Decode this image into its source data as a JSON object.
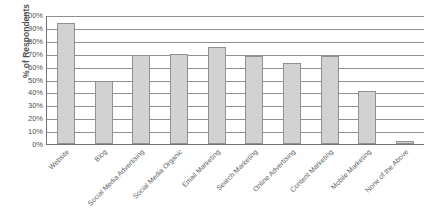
{
  "chart_data": {
    "type": "bar",
    "title": "",
    "xlabel": "",
    "ylabel": "% of Respondents",
    "ylim": [
      0,
      100
    ],
    "grid": true,
    "legend": "none",
    "categories": [
      "Website",
      "Blog",
      "Social Media Advertising",
      "Social Media Organic",
      "Email Marketing",
      "Search Marketing",
      "Online Advertising",
      "Content Marketing",
      "Mobile Marketing",
      "None of the Above"
    ],
    "values": [
      94,
      49,
      69,
      70,
      75,
      68,
      63,
      68,
      41,
      2
    ],
    "y_ticks": [
      "100%",
      "90%",
      "80%",
      "70%",
      "60%",
      "50%",
      "40%",
      "30%",
      "20%",
      "10%",
      "0%"
    ],
    "y_tick_values": [
      100,
      90,
      80,
      70,
      60,
      50,
      40,
      30,
      20,
      10,
      0
    ],
    "colors": {
      "bar_fill": "#d2d2d2",
      "bar_border": "#8e9194",
      "gridline": "#8c9093",
      "axis": "#6f7375",
      "text": "#4d5154"
    }
  }
}
